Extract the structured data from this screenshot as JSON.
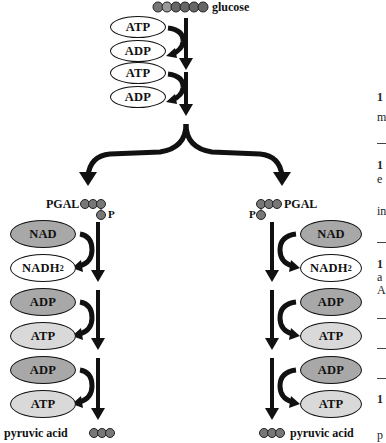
{
  "diagram": {
    "start": {
      "label": "glucose",
      "carbons": 6
    },
    "top_steps": [
      {
        "in": "ATP",
        "out": "ADP"
      },
      {
        "in": "ATP",
        "out": "ADP"
      }
    ],
    "branches": [
      {
        "side": "left",
        "intermediate": "PGAL",
        "phosphate": "P",
        "steps": [
          {
            "in": "NAD",
            "out": "NADH",
            "out_sub": "2"
          },
          {
            "in": "ADP",
            "out": "ATP"
          },
          {
            "in": "ADP",
            "out": "ATP"
          }
        ],
        "product": "pyruvic acid"
      },
      {
        "side": "right",
        "intermediate": "PGAL",
        "phosphate": "P",
        "steps": [
          {
            "in": "NAD",
            "out": "NADH",
            "out_sub": "2"
          },
          {
            "in": "ADP",
            "out": "ATP"
          },
          {
            "in": "ADP",
            "out": "ATP"
          }
        ],
        "product": "pyruvic acid"
      }
    ],
    "colors": {
      "atp_top": "#ffffff",
      "adp_top": "#ffffff",
      "nad": "#a8a8a8",
      "nadh2": "#ffffff",
      "adp": "#a8a8a8",
      "atp": "#d9d9d9",
      "arrow": "#111111"
    }
  },
  "side_text": {
    "fragments": [
      "1",
      "m",
      "1",
      "e",
      "in",
      "1",
      "a",
      "A",
      "1",
      "p"
    ]
  }
}
